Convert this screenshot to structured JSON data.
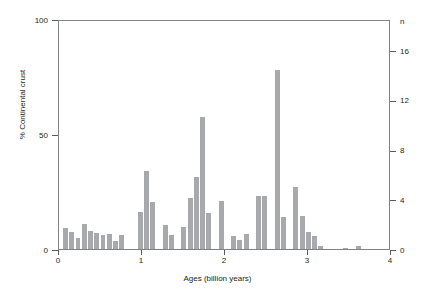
{
  "chart_data": {
    "type": "bar",
    "title": "",
    "subtitle": "",
    "xlabel": "Ages (billion years)",
    "ylabel": "% Continental crust",
    "ylabel_right": "n",
    "xlim": [
      0,
      4
    ],
    "ylim": [
      0,
      100
    ],
    "ylim_right": [
      0,
      18.5
    ],
    "xticks": [
      "0",
      "1",
      "2",
      "3",
      "4"
    ],
    "xtick_values": [
      0,
      1,
      2,
      3,
      4
    ],
    "yticks": [
      "0",
      "50",
      "100"
    ],
    "ytick_values": [
      0,
      50,
      100
    ],
    "yticks_right": [
      "0",
      "4",
      "8",
      "12",
      "16"
    ],
    "ytick_values_right": [
      0,
      4,
      8,
      12,
      16
    ],
    "grid": false,
    "legend": "none",
    "bar_color": "#a7a9ac",
    "axis_color": "#808285",
    "bin_width": 0.075,
    "x": [
      0.05,
      0.125,
      0.2,
      0.275,
      0.35,
      0.425,
      0.5,
      0.575,
      0.65,
      0.725,
      0.8,
      0.875,
      0.95,
      1.025,
      1.1,
      1.175,
      1.25,
      1.325,
      1.4,
      1.475,
      1.55,
      1.625,
      1.7,
      1.775,
      1.85,
      1.925,
      2.0,
      2.075,
      2.15,
      2.225,
      2.3,
      2.375,
      2.45,
      2.525,
      2.6,
      2.675,
      2.75,
      2.825,
      2.9,
      2.975,
      3.05,
      3.125,
      3.2,
      3.275,
      3.425,
      3.575,
      3.65
    ],
    "values": [
      9.0,
      7.5,
      5.0,
      11.0,
      8.0,
      7.0,
      6.0,
      6.5,
      3.5,
      6.0,
      0.0,
      0.0,
      0.0,
      0.0,
      16.0,
      34.0,
      20.5,
      0.0,
      10.5,
      6.0,
      0.0,
      9.5,
      22.0,
      31.5,
      57.5,
      15.5,
      0.0,
      21.0,
      0.0,
      5.5,
      4.0,
      6.5,
      0.0,
      23.0,
      23.0,
      78.0,
      14.0,
      27.0,
      14.5,
      7.5,
      5.5,
      1.5,
      0.0,
      0.0,
      0.5,
      1.5,
      0.0
    ],
    "values_n": [
      1.7,
      1.4,
      0.9,
      2.0,
      1.5,
      1.3,
      1.1,
      1.2,
      0.65,
      1.1,
      0,
      0,
      0,
      0,
      3.0,
      6.3,
      3.8,
      0,
      1.95,
      1.1,
      0,
      1.75,
      4.1,
      5.8,
      10.7,
      2.9,
      0,
      3.9,
      0,
      1.0,
      0.75,
      1.2,
      0,
      4.25,
      4.25,
      14.5,
      2.6,
      5.0,
      2.7,
      1.4,
      1.0,
      0.3,
      0,
      0,
      0.1,
      0.3,
      0
    ],
    "bars": [
      {
        "x": 0.05,
        "value": 9.0,
        "n": 1.7
      },
      {
        "x": 0.125,
        "value": 7.5,
        "n": 1.4
      },
      {
        "x": 0.2,
        "value": 5.0,
        "n": 0.9
      },
      {
        "x": 0.275,
        "value": 11.0,
        "n": 2.0
      },
      {
        "x": 0.35,
        "value": 8.0,
        "n": 1.5
      },
      {
        "x": 0.425,
        "value": 7.0,
        "n": 1.3
      },
      {
        "x": 0.5,
        "value": 6.0,
        "n": 1.1
      },
      {
        "x": 0.575,
        "value": 6.5,
        "n": 1.2
      },
      {
        "x": 0.65,
        "value": 3.5,
        "n": 0.65
      },
      {
        "x": 0.725,
        "value": 6.0,
        "n": 1.1
      },
      {
        "x": 0.95,
        "value": 16.0,
        "n": 3.0
      },
      {
        "x": 1.025,
        "value": 34.0,
        "n": 6.3
      },
      {
        "x": 1.1,
        "value": 20.5,
        "n": 3.8
      },
      {
        "x": 1.25,
        "value": 10.5,
        "n": 1.95
      },
      {
        "x": 1.325,
        "value": 6.0,
        "n": 1.1
      },
      {
        "x": 1.475,
        "value": 9.5,
        "n": 1.75
      },
      {
        "x": 1.55,
        "value": 22.0,
        "n": 4.1
      },
      {
        "x": 1.625,
        "value": 31.5,
        "n": 5.8
      },
      {
        "x": 1.7,
        "value": 57.5,
        "n": 10.7
      },
      {
        "x": 1.775,
        "value": 15.5,
        "n": 2.9
      },
      {
        "x": 1.925,
        "value": 21.0,
        "n": 3.9
      },
      {
        "x": 2.075,
        "value": 5.5,
        "n": 1.0
      },
      {
        "x": 2.15,
        "value": 4.0,
        "n": 0.75
      },
      {
        "x": 2.225,
        "value": 6.5,
        "n": 1.2
      },
      {
        "x": 2.375,
        "value": 23.0,
        "n": 4.25
      },
      {
        "x": 2.45,
        "value": 23.0,
        "n": 4.25
      },
      {
        "x": 2.6,
        "value": 78.0,
        "n": 14.5
      },
      {
        "x": 2.675,
        "value": 14.0,
        "n": 2.6
      },
      {
        "x": 2.825,
        "value": 27.0,
        "n": 5.0
      },
      {
        "x": 2.9,
        "value": 14.5,
        "n": 2.7
      },
      {
        "x": 2.975,
        "value": 7.5,
        "n": 1.4
      },
      {
        "x": 3.05,
        "value": 5.5,
        "n": 1.0
      },
      {
        "x": 3.125,
        "value": 1.5,
        "n": 0.3
      },
      {
        "x": 3.425,
        "value": 0.5,
        "n": 0.1
      },
      {
        "x": 3.575,
        "value": 1.5,
        "n": 0.3
      }
    ]
  }
}
